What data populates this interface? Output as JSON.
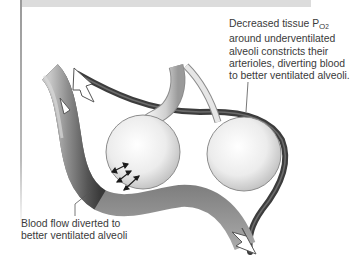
{
  "figure": {
    "type": "diagram"
  },
  "annotations": {
    "top_right": {
      "line_1_prefix": "Decreased tissue P",
      "line_1_sub": "O",
      "line_1_subsub": "2",
      "line_2": "around underventilated",
      "line_3": "alveoli constricts their",
      "line_4": "arterioles, diverting blood",
      "line_5": "to better ventilated alveoli."
    },
    "bottom_left": {
      "line_1": "Blood flow diverted to",
      "line_2": "better ventilated alveoli"
    }
  },
  "elements": {
    "alveoli": [
      {
        "name": "better ventilated alveolus",
        "position": "left"
      },
      {
        "name": "underventilated alveolus",
        "position": "right"
      }
    ],
    "vessels": [
      {
        "name": "dilated arteriole (large vessel)",
        "position": "left/bottom"
      },
      {
        "name": "constricted arteriole (thin vessel)",
        "position": "top/right"
      }
    ],
    "airway": "bronchiole branching to both alveoli",
    "gas_exchange_arrows": 3
  },
  "colors": {
    "vessel_dark": "#3e3e3e",
    "vessel_mid": "#7a7a7a",
    "vessel_light": "#b8b8b8",
    "alveolus_fill": "#eeeeee",
    "text": "#3a3a3a",
    "band": "#dcdcdc"
  }
}
